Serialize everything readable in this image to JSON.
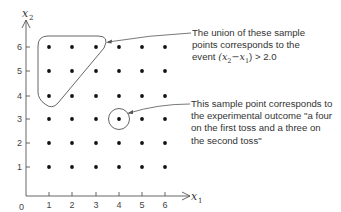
{
  "diagram": {
    "type": "sample-space-grid",
    "x_axis": {
      "label": "x",
      "subscript": "1",
      "ticks": [
        "1",
        "2",
        "3",
        "4",
        "5",
        "6"
      ],
      "origin_label": "0"
    },
    "y_axis": {
      "label": "x",
      "subscript": "2",
      "ticks": [
        "1",
        "2",
        "3",
        "4",
        "5",
        "6"
      ]
    },
    "points": "all pairs (x1, x2) with x1, x2 in {1..6}",
    "highlighted_region": {
      "points": [
        [
          1,
          4
        ],
        [
          1,
          5
        ],
        [
          1,
          6
        ],
        [
          2,
          5
        ],
        [
          2,
          6
        ],
        [
          3,
          6
        ]
      ]
    },
    "highlighted_point": [
      4,
      3
    ],
    "annotations": {
      "region_note": {
        "line1": "The union of these sample",
        "line2": "points corresponds to the",
        "line3_prefix": "event ",
        "line3_math": "(x",
        "line3_sub1": "2",
        "line3_mid": "−x",
        "line3_sub2": "1",
        "line3_suffix": ") > 2.0"
      },
      "point_note": {
        "line1": "This sample point corresponds to",
        "line2": "the experimental outcome \"a four",
        "line3": "on the first toss and a three on",
        "line4": "the second toss\""
      }
    },
    "colors": {
      "ink": "#333333",
      "dot": "#111111",
      "background": "#ffffff"
    }
  }
}
